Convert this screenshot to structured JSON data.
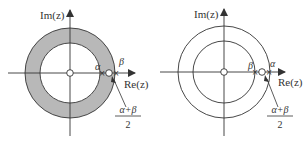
{
  "colors": {
    "stroke": "#333333",
    "annulus_fill": "#b8b8b8",
    "background": "#ffffff"
  },
  "diagrams": [
    {
      "id": "left",
      "shaded": true,
      "axis_labels": {
        "imag": "Im(z)",
        "real": "Re(z)"
      },
      "point_labels": {
        "first": "α",
        "second": "β"
      },
      "fraction": {
        "numerator": "α+β",
        "denominator": "2"
      }
    },
    {
      "id": "right",
      "shaded": false,
      "axis_labels": {
        "imag": "Im(z)",
        "real": "Re(z)"
      },
      "point_labels": {
        "first": "β",
        "second": "α"
      },
      "fraction": {
        "numerator": "α+β",
        "denominator": "2"
      }
    }
  ]
}
